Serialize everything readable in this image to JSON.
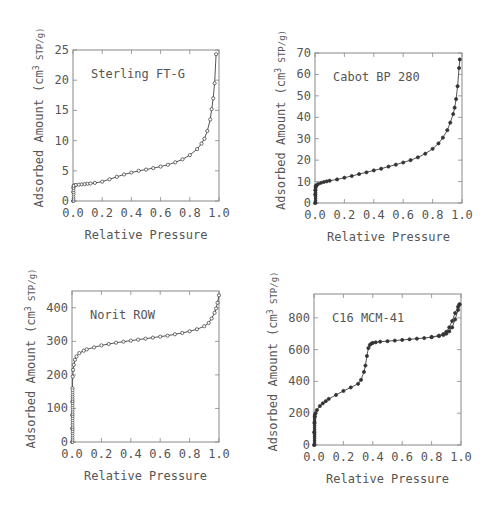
{
  "figure": {
    "shared_xlabel": "Relative Pressure",
    "shared_ylabel": "Adsorbed Amount (cm",
    "ylabel_sup": "3",
    "ylabel_tail": " STP/g)",
    "line_color": "#555555",
    "marker_color": "#333333"
  },
  "chart_data": [
    {
      "type": "line",
      "title": "Sterling FT-G",
      "xlabel": "Relative Pressure",
      "ylabel": "Adsorbed Amount (cm3 STP/g)",
      "xlim": [
        0,
        1.0
      ],
      "ylim": [
        0,
        25
      ],
      "xticks": [
        "0.0",
        "0.2",
        "0.4",
        "0.6",
        "0.8",
        "1.0"
      ],
      "yticks": [
        "0",
        "5",
        "10",
        "15",
        "20",
        "25"
      ],
      "ytick_values": [
        0,
        5,
        10,
        15,
        20,
        25
      ],
      "marker": "open-circle",
      "grid": false,
      "box": {
        "left": 73,
        "top": 50,
        "right": 219,
        "bottom": 201
      },
      "x": [
        0.0,
        0.001,
        0.002,
        0.005,
        0.01,
        0.02,
        0.04,
        0.06,
        0.08,
        0.1,
        0.12,
        0.15,
        0.2,
        0.25,
        0.3,
        0.35,
        0.4,
        0.45,
        0.5,
        0.55,
        0.6,
        0.65,
        0.7,
        0.75,
        0.8,
        0.85,
        0.88,
        0.9,
        0.92,
        0.94,
        0.95,
        0.96,
        0.97,
        0.98
      ],
      "y": [
        0.0,
        1.5,
        2.2,
        2.5,
        2.6,
        2.65,
        2.7,
        2.75,
        2.8,
        2.85,
        2.9,
        3.0,
        3.2,
        3.6,
        4.0,
        4.4,
        4.7,
        5.0,
        5.2,
        5.45,
        5.7,
        6.0,
        6.4,
        6.9,
        7.6,
        8.6,
        9.5,
        10.3,
        11.6,
        13.5,
        15.2,
        17.0,
        19.5,
        24.3
      ]
    },
    {
      "type": "line",
      "title": "Cabot BP 280",
      "xlabel": "Relative Pressure",
      "ylabel": "Adsorbed Amount (cm3 STP/g)",
      "xlim": [
        0,
        1.0
      ],
      "ylim": [
        0,
        70
      ],
      "xticks": [
        "0.0",
        "0.2",
        "0.4",
        "0.6",
        "0.8",
        "1.0"
      ],
      "yticks": [
        "0",
        "10",
        "20",
        "30",
        "40",
        "50",
        "60",
        "70"
      ],
      "ytick_values": [
        0,
        10,
        20,
        30,
        40,
        50,
        60,
        70
      ],
      "marker": "filled-circle",
      "grid": false,
      "box": {
        "left": 315,
        "top": 53,
        "right": 462,
        "bottom": 203
      },
      "x": [
        0.0,
        0.001,
        0.002,
        0.005,
        0.01,
        0.02,
        0.04,
        0.06,
        0.08,
        0.1,
        0.15,
        0.2,
        0.25,
        0.3,
        0.35,
        0.4,
        0.45,
        0.5,
        0.55,
        0.6,
        0.65,
        0.7,
        0.75,
        0.8,
        0.84,
        0.87,
        0.9,
        0.92,
        0.94,
        0.95,
        0.96,
        0.97,
        0.98,
        0.985
      ],
      "y": [
        0.0,
        4.0,
        6.0,
        7.5,
        8.2,
        8.8,
        9.4,
        9.8,
        10.1,
        10.4,
        11.0,
        11.8,
        12.6,
        13.5,
        14.3,
        15.2,
        16.0,
        17.0,
        17.9,
        18.9,
        20.0,
        21.3,
        23.0,
        25.3,
        27.8,
        30.5,
        34.0,
        37.5,
        41.5,
        44.5,
        48.5,
        54.5,
        63.0,
        67.0
      ]
    },
    {
      "type": "line",
      "title": "Norit ROW",
      "xlabel": "Relative Pressure",
      "ylabel": "Adsorbed Amount (cm3 STP/g)",
      "xlim": [
        0,
        1.0
      ],
      "ylim": [
        0,
        450
      ],
      "xticks": [
        "0.0",
        "0.2",
        "0.4",
        "0.6",
        "0.8",
        "1.0"
      ],
      "yticks": [
        "0",
        "100",
        "200",
        "300",
        "400"
      ],
      "ytick_values": [
        0,
        100,
        200,
        300,
        400
      ],
      "marker": "open-circle",
      "grid": false,
      "box": {
        "left": 72,
        "top": 291,
        "right": 219,
        "bottom": 442
      },
      "x": [
        0.0,
        0.0005,
        0.001,
        0.002,
        0.003,
        0.005,
        0.008,
        0.012,
        0.02,
        0.03,
        0.05,
        0.08,
        0.1,
        0.15,
        0.2,
        0.25,
        0.3,
        0.35,
        0.4,
        0.45,
        0.5,
        0.55,
        0.6,
        0.65,
        0.7,
        0.75,
        0.8,
        0.85,
        0.9,
        0.93,
        0.95,
        0.97,
        0.98,
        0.99,
        1.0
      ],
      "y": [
        0.0,
        40,
        80,
        120,
        160,
        195,
        215,
        230,
        245,
        255,
        265,
        272,
        276,
        282,
        288,
        292,
        296,
        299,
        302,
        305,
        308,
        311,
        314,
        317,
        321,
        325,
        330,
        336,
        345,
        355,
        368,
        385,
        398,
        415,
        437
      ]
    },
    {
      "type": "line",
      "title": "C16 MCM-41",
      "xlabel": "Relative Pressure",
      "ylabel": "Adsorbed Amount (cm3 STP/g)",
      "xlim": [
        0,
        1.0
      ],
      "ylim": [
        0,
        950
      ],
      "xticks": [
        "0.0",
        "0.2",
        "0.4",
        "0.6",
        "0.8",
        "1.0"
      ],
      "yticks": [
        "0",
        "200",
        "400",
        "600",
        "800"
      ],
      "ytick_values": [
        0,
        200,
        400,
        600,
        800
      ],
      "marker": "filled-circle",
      "grid": false,
      "box": {
        "left": 314,
        "top": 294,
        "right": 461,
        "bottom": 445
      },
      "series": [
        {
          "name": "adsorption",
          "x": [
            0.0,
            0.001,
            0.003,
            0.006,
            0.01,
            0.02,
            0.04,
            0.06,
            0.08,
            0.1,
            0.15,
            0.2,
            0.25,
            0.3,
            0.32,
            0.34,
            0.35,
            0.36,
            0.37,
            0.38,
            0.39,
            0.4,
            0.42,
            0.45,
            0.5,
            0.55,
            0.6,
            0.65,
            0.7,
            0.75,
            0.8,
            0.85,
            0.88,
            0.9,
            0.92,
            0.94,
            0.96,
            0.98,
            0.99
          ],
          "y": [
            0.0,
            80,
            140,
            180,
            200,
            220,
            245,
            262,
            276,
            290,
            315,
            340,
            362,
            385,
            410,
            460,
            500,
            560,
            610,
            630,
            638,
            642,
            646,
            650,
            653,
            657,
            661,
            665,
            669,
            673,
            678,
            685,
            692,
            700,
            715,
            740,
            790,
            850,
            885
          ]
        },
        {
          "name": "desorption",
          "x": [
            0.99,
            0.98,
            0.96,
            0.94,
            0.92,
            0.9,
            0.88,
            0.85,
            0.8
          ],
          "y": [
            885,
            870,
            830,
            780,
            740,
            712,
            698,
            688,
            680
          ]
        }
      ]
    }
  ]
}
